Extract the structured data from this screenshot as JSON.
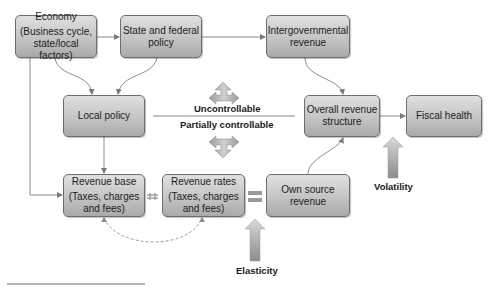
{
  "nodes": {
    "economy": {
      "title": "Economy",
      "sub": "(Business cycle, state/local factors)"
    },
    "state_federal": {
      "title": "State and federal policy"
    },
    "intergovernmental": {
      "title": "Intergovernmental revenue"
    },
    "local_policy": {
      "title": "Local policy"
    },
    "overall_revenue": {
      "title": "Overall revenue structure"
    },
    "fiscal_health": {
      "title": "Fiscal health"
    },
    "revenue_base": {
      "title": "Revenue base",
      "sub": "(Taxes, charges and fees)"
    },
    "revenue_rates": {
      "title": "Revenue rates",
      "sub": "(Taxes, charges and fees)"
    },
    "own_source": {
      "title": "Own source revenue"
    }
  },
  "labels": {
    "uncontrollable": "Uncontrollable",
    "partially_controllable": "Partially controllable",
    "volatility": "Volatility",
    "elasticity": "Elasticity"
  },
  "colors": {
    "line": "#8a8a8a",
    "box_border": "#6e6e6e",
    "dashed": "#a0a0a0"
  }
}
